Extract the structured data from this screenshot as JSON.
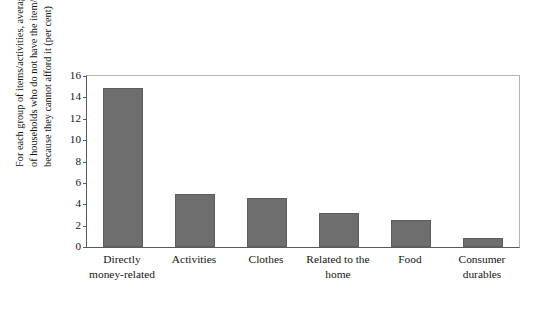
{
  "chart_data": {
    "type": "bar",
    "title": "",
    "xlabel": "",
    "ylabel": "For each group of items/activities, average proportion of households who do not have the item/activity because they cannot afford it (per cent)",
    "ylabel_lines": [
      "For each group of items/activities, average proportion",
      "of households who do not have the item/activity",
      "because they cannot afford it (per cent)"
    ],
    "categories": [
      "Directly money-related",
      "Activities",
      "Clothes",
      "Related to the home",
      "Food",
      "Consumer durables"
    ],
    "category_lines": [
      [
        "Directly",
        "money-related"
      ],
      [
        "Activities"
      ],
      [
        "Clothes"
      ],
      [
        "Related to the",
        "home"
      ],
      [
        "Food"
      ],
      [
        "Consumer",
        "durables"
      ]
    ],
    "values": [
      14.9,
      5.0,
      4.6,
      3.2,
      2.5,
      0.8
    ],
    "ylim": [
      0,
      16
    ],
    "yticks": [
      0,
      2,
      4,
      6,
      8,
      10,
      12,
      14,
      16
    ],
    "ytick_labels": [
      "0",
      "2",
      "4",
      "6",
      "8",
      "10",
      "12",
      "14",
      "16"
    ],
    "grid": false,
    "legend": false,
    "bar_color": "#6e6e6e",
    "axis_color": "#5a5a5a",
    "frame_color": "#b4b4b4"
  }
}
